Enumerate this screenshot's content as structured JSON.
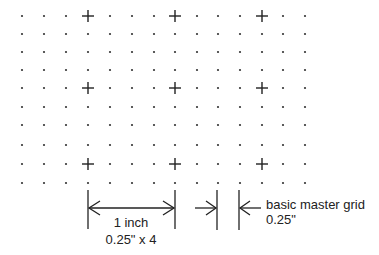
{
  "diagram": {
    "grid": {
      "columns_x": [
        22,
        44,
        66,
        88,
        110,
        132,
        154,
        175,
        197,
        218,
        240,
        262,
        283,
        305
      ],
      "rows_y": [
        16,
        34,
        52,
        70,
        88,
        107,
        125,
        145,
        164,
        183
      ],
      "plus_columns_x": [
        88,
        175,
        262
      ],
      "plus_rows_y": [
        16,
        88,
        164
      ],
      "dot_color": "#333333"
    },
    "dimension_inch": {
      "label": "1 inch",
      "sublabel": "0.25\" x 4",
      "x_start": 88,
      "x_end": 175
    },
    "dimension_grid": {
      "label": "basic master grid",
      "sublabel": "0.25\"",
      "x_start": 217,
      "x_end": 239
    },
    "line_color": "#222222"
  }
}
